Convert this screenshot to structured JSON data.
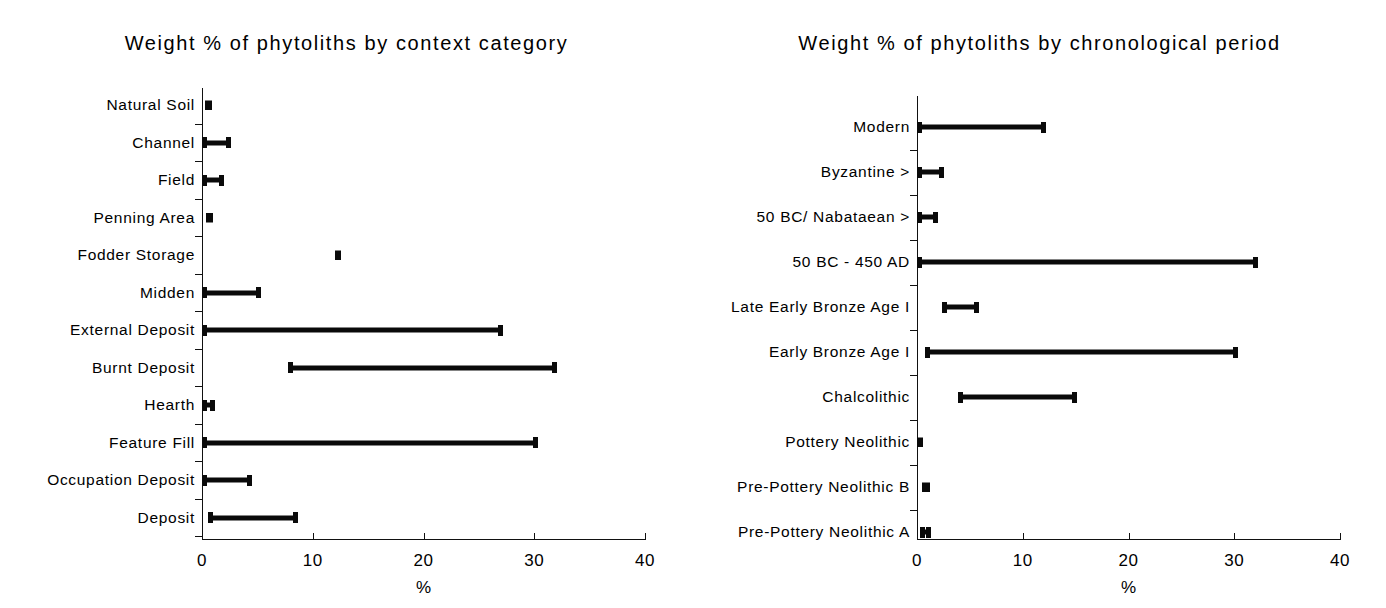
{
  "figure": {
    "axis_caption": "%",
    "accent_color": "#0a0a0a"
  },
  "chart_data": [
    {
      "type": "bar",
      "orientation": "horizontal",
      "subtype": "range-bar (min-max whisker)",
      "title": "Weight % of phytoliths by context category",
      "xlabel": "%",
      "ylabel": "",
      "xlim": [
        0,
        40
      ],
      "xticks": [
        0,
        10,
        20,
        30,
        40
      ],
      "xticklabels": [
        "0",
        "10",
        "20",
        "30",
        "40"
      ],
      "grid": false,
      "legend": null,
      "categories": [
        "Natural Soil",
        "Channel",
        "Field",
        "Penning Area",
        "Fodder Storage",
        "Midden",
        "External Deposit",
        "Burnt Deposit",
        "Hearth",
        "Feature Fill",
        "Occupation Deposit",
        "Deposit"
      ],
      "series": [
        {
          "name": "minimum",
          "values": [
            0.3,
            0.0,
            0.0,
            0.4,
            12.0,
            0.0,
            0.0,
            7.8,
            0.0,
            0.0,
            0.0,
            0.5
          ]
        },
        {
          "name": "maximum",
          "values": [
            0.9,
            2.6,
            2.0,
            1.0,
            12.5,
            5.3,
            27.2,
            32.1,
            1.2,
            30.3,
            4.5,
            8.7
          ]
        }
      ]
    },
    {
      "type": "bar",
      "orientation": "horizontal",
      "subtype": "range-bar (min-max whisker)",
      "title": "Weight % of phytoliths by chronological period",
      "xlabel": "%",
      "ylabel": "",
      "xlim": [
        0,
        40
      ],
      "xticks": [
        0,
        10,
        20,
        30,
        40
      ],
      "xticklabels": [
        "0",
        "10",
        "20",
        "30",
        "40"
      ],
      "grid": false,
      "legend": null,
      "categories": [
        "Modern",
        "Byzantine >",
        "50 BC/ Nabataean >",
        "50 BC - 450 AD",
        "Late Early Bronze Age I",
        "Early Bronze Age I",
        "Chalcolithic",
        "Pottery Neolithic",
        "Pre-Pottery Neolithic B",
        "Pre-Pottery Neolithic A"
      ],
      "series": [
        {
          "name": "minimum",
          "values": [
            0.0,
            0.0,
            0.0,
            0.0,
            2.4,
            0.8,
            3.9,
            0.0,
            0.5,
            0.3
          ]
        },
        {
          "name": "maximum",
          "values": [
            12.2,
            2.6,
            2.0,
            32.2,
            5.9,
            30.4,
            15.1,
            0.4,
            1.2,
            1.3
          ]
        }
      ]
    }
  ]
}
